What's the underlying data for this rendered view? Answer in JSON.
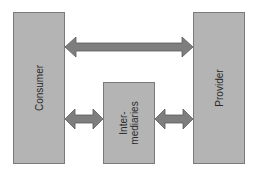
{
  "diagram": {
    "type": "block-diagram",
    "nodes": [
      {
        "id": "consumer",
        "label": "Consumer"
      },
      {
        "id": "intermediaries",
        "label_lines": [
          "Inter-",
          "mediaries"
        ]
      },
      {
        "id": "provider",
        "label": "Provider"
      }
    ],
    "edges": [
      {
        "from": "consumer",
        "to": "provider",
        "direction": "bidirectional"
      },
      {
        "from": "consumer",
        "to": "intermediaries",
        "direction": "bidirectional"
      },
      {
        "from": "intermediaries",
        "to": "provider",
        "direction": "bidirectional"
      }
    ],
    "colors": {
      "box_fill": "#b4b4b4",
      "box_border": "#7a7a7a",
      "arrow_fill": "#7e7e7e",
      "text": "#2a2a2a",
      "background": "#ffffff"
    }
  }
}
